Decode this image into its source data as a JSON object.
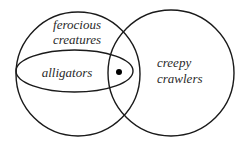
{
  "diagram": {
    "type": "venn",
    "sets": [
      {
        "id": "ferocious-creatures",
        "label_lines": [
          "ferocious",
          "creatures"
        ]
      },
      {
        "id": "creepy-crawlers",
        "label_lines": [
          "creepy",
          "crawlers"
        ]
      },
      {
        "id": "alligators",
        "label_lines": [
          "alligators"
        ]
      }
    ],
    "labels": {
      "ferocious_line1": "ferocious",
      "ferocious_line2": "creatures",
      "creepy_line1": "creepy",
      "creepy_line2": "crawlers",
      "alligators": "alligators"
    },
    "marker": {
      "type": "dot",
      "region": "alligators ∩ creepy crawlers"
    },
    "colors": {
      "stroke": "#1a1a1a",
      "text": "#2a2a2a",
      "background": "#ffffff"
    }
  }
}
